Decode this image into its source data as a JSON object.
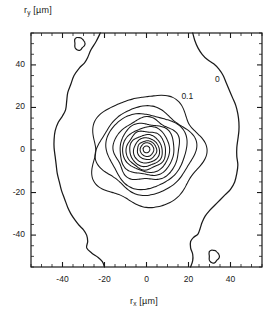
{
  "figure": {
    "background": "#ffffff",
    "line_color": "#1a1a1a"
  },
  "axes": {
    "y_label": "r",
    "y_label_sub": "y",
    "y_label_unit": " [µm]",
    "x_label": "r",
    "x_label_sub": "x",
    "x_label_unit": " [µm]"
  },
  "chart_data": {
    "type": "heatmap",
    "title": "",
    "xlabel": "r_x [µm]",
    "ylabel": "r_y [µm]",
    "xlim": [
      -55,
      55
    ],
    "ylim": [
      -55,
      55
    ],
    "grid": false,
    "legend": "none",
    "x_ticks": [
      -40,
      -20,
      0,
      20,
      40
    ],
    "y_ticks": [
      -40,
      -20,
      0,
      20,
      40
    ],
    "x_tick_labels": [
      "-40",
      "-20",
      "0",
      "20",
      "40"
    ],
    "y_tick_labels": [
      "-40",
      "-20",
      "0",
      "20",
      "40"
    ],
    "minor_tick_interval": 5,
    "annotations": [
      {
        "text": "0",
        "x": 35,
        "y": 33
      },
      {
        "text": "0.1",
        "x": 19,
        "y": 25
      }
    ],
    "contour_levels": [
      0,
      0.1,
      0.2,
      0.3,
      0.4,
      0.5,
      0.6,
      0.7,
      0.8,
      0.9,
      0.95,
      0.99
    ],
    "peak": {
      "x": 0,
      "y": 0,
      "value": 1.0
    },
    "contours": [
      {
        "level": 0.99,
        "radius_x": 1.6,
        "radius_y": 1.6
      },
      {
        "level": 0.95,
        "radius_x": 3.2,
        "radius_y": 3.2
      },
      {
        "level": 0.9,
        "radius_x": 4.6,
        "radius_y": 4.4
      },
      {
        "level": 0.8,
        "radius_x": 6.2,
        "radius_y": 5.9
      },
      {
        "level": 0.7,
        "radius_x": 7.8,
        "radius_y": 7.4
      },
      {
        "level": 0.6,
        "radius_x": 9.4,
        "radius_y": 9.0
      },
      {
        "level": 0.5,
        "radius_x": 11.2,
        "radius_y": 10.6
      },
      {
        "level": 0.4,
        "radius_x": 13.2,
        "radius_y": 12.4
      },
      {
        "level": 0.3,
        "radius_x": 15.6,
        "radius_y": 14.6
      },
      {
        "level": 0.2,
        "radius_x": 19.0,
        "radius_y": 17.6
      },
      {
        "level": 0.15,
        "radius_x": 22.6,
        "radius_y": 20.0
      },
      {
        "level": 0.1,
        "radius_x": 26.5,
        "radius_y": 26.0
      }
    ],
    "zero_level_islands": [
      {
        "x": -32,
        "y": 50,
        "rx": 2.4,
        "ry": 3.0
      },
      {
        "x": 32,
        "y": -50,
        "rx": 2.4,
        "ry": 3.0
      }
    ]
  }
}
